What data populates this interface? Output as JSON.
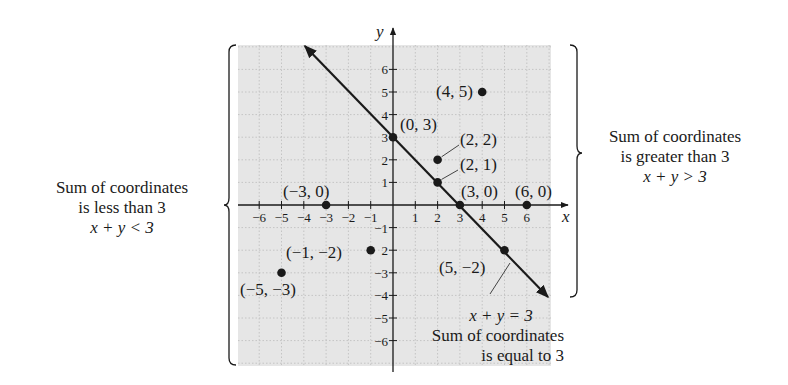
{
  "chart_data": {
    "type": "scatter",
    "title": "",
    "xlabel": "x",
    "ylabel": "y",
    "xlim": [
      -7,
      7
    ],
    "ylim": [
      -7,
      7
    ],
    "grid": true,
    "x_ticks": [
      -6,
      -5,
      -4,
      -3,
      -2,
      -1,
      1,
      2,
      3,
      4,
      5,
      6
    ],
    "y_ticks": [
      -6,
      -5,
      -4,
      -3,
      -2,
      -1,
      1,
      2,
      3,
      4,
      5,
      6
    ],
    "x_tick_labels": [
      "−6",
      "−5",
      "−4",
      "−3",
      "−2",
      "−1",
      "1",
      "2",
      "3",
      "4",
      "5",
      "6"
    ],
    "y_tick_labels": [
      "−6",
      "−5",
      "−4",
      "−3",
      "2",
      "−1",
      "1",
      "2",
      "3",
      "4",
      "5",
      "6"
    ],
    "line": {
      "equation": "x + y = 3",
      "from": [
        -4,
        7
      ],
      "to": [
        7,
        -4
      ],
      "label": "x + y = 3",
      "description": "Sum of coordinates is equal to 3"
    },
    "points": [
      {
        "x": 4,
        "y": 5,
        "label": "(4, 5)"
      },
      {
        "x": 0,
        "y": 3,
        "label": "(0, 3)"
      },
      {
        "x": 2,
        "y": 2,
        "label": "(2, 2)"
      },
      {
        "x": 2,
        "y": 1,
        "label": "(2, 1)"
      },
      {
        "x": 3,
        "y": 0,
        "label": "(3, 0)"
      },
      {
        "x": 6,
        "y": 0,
        "label": "(6, 0)"
      },
      {
        "x": -3,
        "y": 0,
        "label": "(−3, 0)"
      },
      {
        "x": -1,
        "y": -2,
        "label": "(−1, −2)"
      },
      {
        "x": -5,
        "y": -3,
        "label": "(−5, −3)"
      },
      {
        "x": 5,
        "y": -2,
        "label": "(5, −2)"
      }
    ],
    "regions": [
      {
        "side": "left",
        "text": [
          "Sum of coordinates",
          "is less than 3"
        ],
        "inequality": "x + y < 3"
      },
      {
        "side": "right",
        "text": [
          "Sum of coordinates",
          "is greater than 3"
        ],
        "inequality": "x + y > 3"
      }
    ]
  },
  "labels": {
    "left_line1": "Sum of coordinates",
    "left_line2": "is less than 3",
    "left_ineq": "x + y < 3",
    "right_line1": "Sum of coordinates",
    "right_line2": "is greater than 3",
    "right_ineq": "x + y > 3",
    "bottom_eq": "x + y = 3",
    "bottom_line1": "Sum of coordinates",
    "bottom_line2": "is equal to 3",
    "x_axis": "x",
    "y_axis": "y"
  },
  "colors": {
    "plot_bg": "#e6e6e6",
    "grid": "#c4c4c4",
    "ink": "#1a1a1a"
  }
}
